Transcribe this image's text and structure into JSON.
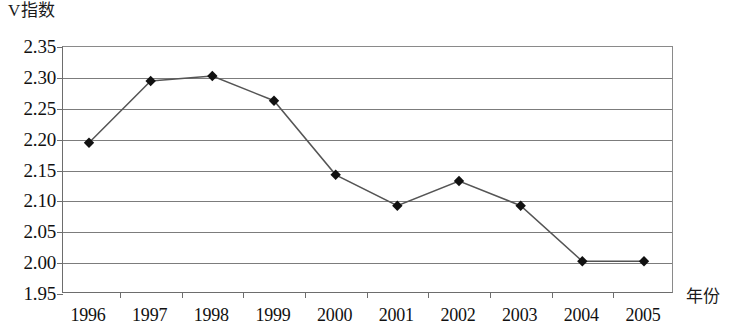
{
  "chart_data": {
    "type": "line",
    "title": "",
    "ylabel": "V指数",
    "xlabel": "年份",
    "categories": [
      "1996",
      "1997",
      "1998",
      "1999",
      "2000",
      "2001",
      "2002",
      "2003",
      "2004",
      "2005"
    ],
    "values": [
      2.195,
      2.295,
      2.303,
      2.263,
      2.143,
      2.093,
      2.133,
      2.093,
      2.003,
      2.003
    ],
    "ylim": [
      1.95,
      2.35
    ],
    "ytick_labels": [
      "2.35",
      "2.30",
      "2.25",
      "2.20",
      "2.15",
      "2.10",
      "2.05",
      "2.00",
      "1.95"
    ],
    "ytick_values": [
      2.35,
      2.3,
      2.25,
      2.2,
      2.15,
      2.1,
      2.05,
      2.0,
      1.95
    ],
    "ystep": 0.05,
    "grid": true,
    "legend": "none",
    "marker": "diamond",
    "marker_color": "#111111",
    "line_color": "#555555",
    "grid_color": "#7c7c7c",
    "axis_color": "#6d6d6d"
  },
  "axes": {
    "y_title": "V指数",
    "x_title": "年份"
  }
}
